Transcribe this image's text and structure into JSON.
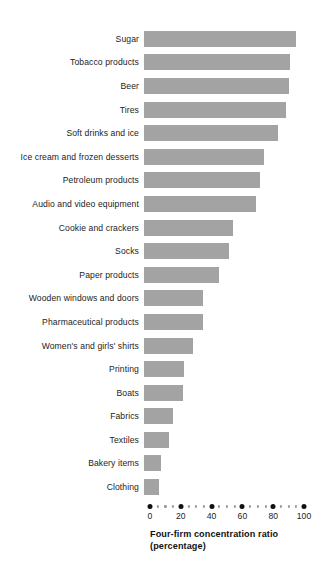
{
  "chart_data": {
    "type": "bar",
    "orientation": "horizontal",
    "title": "",
    "xlabel": "Four-firm concentration ratio (percentage)",
    "xlabel_lines": [
      "Four-firm concentration ratio",
      "(percentage)"
    ],
    "ylabel": "",
    "xlim": [
      0,
      100
    ],
    "xticks": [
      0,
      20,
      40,
      60,
      80,
      100
    ],
    "xtick_labels": [
      "0",
      "20",
      "40",
      "60",
      "80",
      "100"
    ],
    "minor_tick_interval": 5,
    "grid": false,
    "legend": "none",
    "bar_color": "#a3a3a3",
    "axis_color": "#111111",
    "categories": [
      "Sugar",
      "Tobacco products",
      "Beer",
      "Tires",
      "Soft drinks and ice",
      "Ice cream and frozen desserts",
      "Petroleum products",
      "Audio and video equipment",
      "Cookie and crackers",
      "Socks",
      "Paper products",
      "Wooden windows and doors",
      "Pharmaceutical products",
      "Women's and girls' shirts",
      "Printing",
      "Boats",
      "Fabrics",
      "Textiles",
      "Bakery items",
      "Clothing"
    ],
    "values": [
      99,
      95,
      94,
      92,
      87,
      78,
      75,
      73,
      58,
      55,
      49,
      38,
      38,
      32,
      26,
      25,
      19,
      16,
      11,
      10
    ]
  }
}
